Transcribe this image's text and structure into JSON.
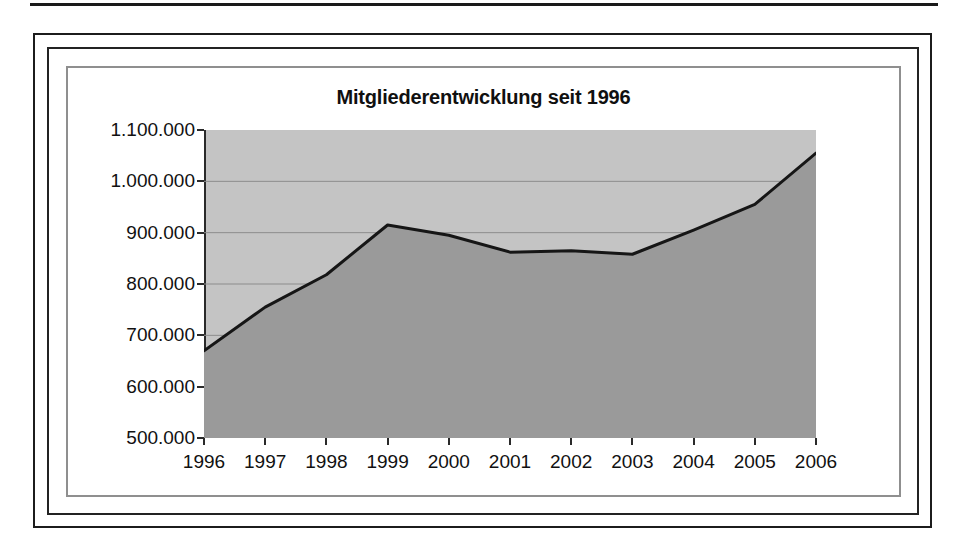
{
  "figure": {
    "frame_style": "triple-nested-border",
    "border_colors": {
      "outer": "#1c1c1c",
      "middle": "#232323",
      "inner": "#8f8f8f"
    }
  },
  "chart_data": {
    "type": "area",
    "title": "Mitgliederentwicklung seit 1996",
    "xlabel": "",
    "ylabel": "",
    "categories": [
      "1996",
      "1997",
      "1998",
      "1999",
      "2000",
      "2001",
      "2002",
      "2003",
      "2004",
      "2005",
      "2006"
    ],
    "values": [
      670000,
      755000,
      818000,
      915000,
      895000,
      862000,
      865000,
      858000,
      905000,
      955000,
      1055000
    ],
    "ylim": [
      500000,
      1100000
    ],
    "ytick_values": [
      500000,
      600000,
      700000,
      800000,
      900000,
      1000000,
      1100000
    ],
    "ytick_labels": [
      "500.000",
      "600.000",
      "700.000",
      "800.000",
      "900.000",
      "1.000.000",
      "1.100.000"
    ],
    "xtick_labels": [
      "1996",
      "1997",
      "1998",
      "1999",
      "2000",
      "2001",
      "2002",
      "2003",
      "2004",
      "2005",
      "2006"
    ],
    "grid": true,
    "grid_axis": "y",
    "legend": false,
    "legend_position": "none",
    "series": [
      {
        "name": "Mitglieder",
        "values": [
          670000,
          755000,
          818000,
          915000,
          895000,
          862000,
          865000,
          858000,
          905000,
          955000,
          1055000
        ]
      }
    ],
    "colors": {
      "plot_background": "#c4c4c4",
      "area_fill": "#9a9a9a",
      "line": "#161616",
      "gridline": "#8c8c8c",
      "axis": "#2a2a2a",
      "text": "#111111"
    },
    "number_format": "de-DE",
    "annotations": []
  }
}
